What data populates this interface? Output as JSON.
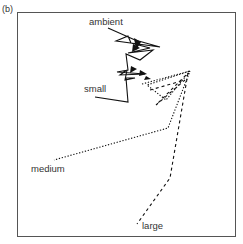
{
  "panel_label": "(b)",
  "labels": {
    "ambient": "ambient",
    "small": "small",
    "medium": "medium",
    "large": "large"
  },
  "trajectories": [
    {
      "name": "ambient",
      "style": "solid",
      "points": [
        [
          108,
          28
        ],
        [
          135,
          40
        ],
        [
          160,
          47
        ],
        [
          116,
          41
        ],
        [
          128,
          36
        ],
        [
          131,
          43
        ],
        [
          150,
          48
        ],
        [
          128,
          53
        ],
        [
          153,
          50
        ],
        [
          140,
          60
        ],
        [
          126,
          54
        ],
        [
          128,
          70
        ],
        [
          117,
          72
        ],
        [
          145,
          74
        ],
        [
          120,
          75
        ],
        [
          127,
          70
        ]
      ]
    },
    {
      "name": "small",
      "style": "solid",
      "points": [
        [
          127,
          70
        ],
        [
          125,
          80
        ],
        [
          135,
          78
        ],
        [
          126,
          78
        ],
        [
          128,
          102
        ],
        [
          95,
          97
        ]
      ]
    },
    {
      "name": "medium",
      "style": "dotted",
      "points": [
        [
          142,
          84
        ],
        [
          190,
          71
        ],
        [
          147,
          85
        ],
        [
          166,
          100
        ],
        [
          190,
          71
        ],
        [
          168,
          128
        ],
        [
          54,
          160
        ]
      ]
    },
    {
      "name": "large",
      "style": "dashed",
      "points": [
        [
          150,
          90
        ],
        [
          185,
          80
        ],
        [
          156,
          105
        ],
        [
          188,
          73
        ],
        [
          170,
          178
        ],
        [
          137,
          224
        ]
      ]
    }
  ],
  "markers": [
    [
      [
        134,
        38
      ],
      [
        141,
        42
      ],
      [
        136,
        50
      ]
    ],
    [
      [
        133,
        44
      ],
      [
        140,
        48
      ],
      [
        132,
        52
      ]
    ],
    [
      [
        131,
        66
      ],
      [
        137,
        69
      ],
      [
        130,
        73
      ]
    ],
    [
      [
        140,
        70
      ],
      [
        147,
        74
      ],
      [
        139,
        76
      ]
    ],
    [
      [
        146,
        76
      ],
      [
        151,
        79
      ],
      [
        144,
        80
      ]
    ]
  ]
}
